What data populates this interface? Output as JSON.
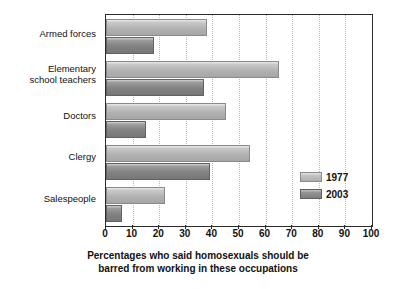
{
  "chart_data": {
    "type": "bar",
    "orientation": "horizontal",
    "title": "",
    "xlabel_line1": "Percentages who said homosexuals should be",
    "xlabel_line2": "barred from working in these occupations",
    "ylabel": "",
    "xlim": [
      0,
      100
    ],
    "xticks": [
      0,
      10,
      20,
      30,
      40,
      50,
      60,
      70,
      80,
      90,
      100
    ],
    "xtick_labels": [
      "0",
      "10",
      "20",
      "30",
      "40",
      "50",
      "60",
      "70",
      "80",
      "90",
      "100"
    ],
    "grid": "vertical-dotted",
    "legend_position": "inside-right-lower",
    "categories": [
      "Armed forces",
      "Elementary\nschool teachers",
      "Doctors",
      "Clergy",
      "Salespeople"
    ],
    "series": [
      {
        "name": "1977",
        "color": "#b4b4b4",
        "values": [
          38,
          65,
          45,
          54,
          22
        ]
      },
      {
        "name": "2003",
        "color": "#848484",
        "values": [
          18,
          37,
          15,
          39,
          6
        ]
      }
    ]
  },
  "legend": {
    "entries": [
      {
        "label": "1977"
      },
      {
        "label": "2003"
      }
    ]
  }
}
